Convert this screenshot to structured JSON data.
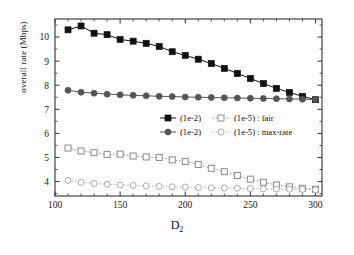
{
  "chart_data": {
    "type": "line",
    "title": "",
    "xlabel": "D2",
    "xlabel_base": "D",
    "xlabel_sub": "2",
    "ylabel": "overall rate (Mbps)",
    "xlim": [
      100,
      305
    ],
    "ylim": [
      3.4,
      10.75
    ],
    "xticks": [
      100,
      150,
      200,
      250,
      300
    ],
    "yticks": [
      4,
      5,
      6,
      7,
      8,
      9,
      10
    ],
    "grid": false,
    "legend_position": "center",
    "x": [
      110,
      120,
      130,
      140,
      150,
      160,
      170,
      180,
      190,
      200,
      210,
      220,
      230,
      240,
      250,
      260,
      270,
      280,
      290,
      300
    ],
    "series": [
      {
        "name": "(1e-2) : fair",
        "marker": "filled-square",
        "linestyle": "solid",
        "color": "#111111",
        "values": [
          10.3,
          10.46,
          10.16,
          10.1,
          9.9,
          9.83,
          9.74,
          9.61,
          9.39,
          9.24,
          9.08,
          8.9,
          8.7,
          8.49,
          8.28,
          8.07,
          7.87,
          7.7,
          7.54,
          7.4
        ]
      },
      {
        "name": "(1e-2) : max-rate",
        "marker": "filled-circle",
        "linestyle": "solid",
        "color": "#555555",
        "values": [
          7.79,
          7.71,
          7.67,
          7.63,
          7.6,
          7.58,
          7.56,
          7.54,
          7.53,
          7.51,
          7.5,
          7.49,
          7.48,
          7.47,
          7.46,
          7.45,
          7.44,
          7.43,
          7.42,
          7.41
        ]
      },
      {
        "name": "(1e-5) : fair",
        "marker": "open-square",
        "linestyle": "dotted",
        "color": "#8a8a8a",
        "values": [
          5.39,
          5.27,
          5.2,
          5.13,
          5.14,
          5.06,
          5.02,
          5.0,
          4.9,
          4.83,
          4.71,
          4.55,
          4.41,
          4.25,
          4.1,
          3.97,
          3.86,
          3.78,
          3.72,
          3.68
        ]
      },
      {
        "name": "(1e-5) : max-rate",
        "marker": "open-circle",
        "linestyle": "dotted",
        "color": "#aaaaaa",
        "values": [
          4.05,
          3.97,
          3.92,
          3.89,
          3.86,
          3.84,
          3.82,
          3.8,
          3.78,
          3.77,
          3.75,
          3.74,
          3.73,
          3.72,
          3.71,
          3.7,
          3.69,
          3.68,
          3.67,
          3.66
        ]
      }
    ],
    "legend": [
      {
        "left_marker": "filled-square",
        "left_label": "(1e-2)",
        "right_marker": "open-square",
        "right_label": "(1e-5) : fair"
      },
      {
        "left_marker": "filled-circle",
        "left_label": "(1e-2)",
        "right_marker": "open-circle",
        "right_label": "(1e-5) : max-rate"
      }
    ]
  }
}
